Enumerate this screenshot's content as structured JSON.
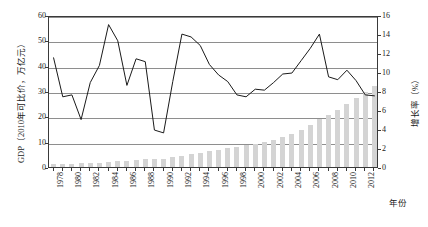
{
  "chart_data": {
    "type": "bar",
    "title": "",
    "subtitle": "",
    "xlabel": "年份",
    "ylabel": "GDP（2010年可比价，万亿元）",
    "ylabel_right": "增长率（%）",
    "ylim": [
      0,
      60
    ],
    "ylim_right": [
      0,
      16
    ],
    "yticks": [
      0,
      10,
      20,
      30,
      40,
      50,
      60
    ],
    "yticks_right": [
      0,
      2,
      4,
      6,
      8,
      10,
      12,
      14,
      16
    ],
    "grid": true,
    "legend": "none",
    "xtick_labels": [
      "1978",
      "1980",
      "1982",
      "1984",
      "1986",
      "1988",
      "1990",
      "1992",
      "1994",
      "1996",
      "1998",
      "2000",
      "2002",
      "2004",
      "2006",
      "2008",
      "2010",
      "2012"
    ],
    "x": [
      1978,
      1979,
      1980,
      1981,
      1982,
      1983,
      1984,
      1985,
      1986,
      1987,
      1988,
      1989,
      1990,
      1991,
      1992,
      1993,
      1994,
      1995,
      1996,
      1997,
      1998,
      1999,
      2000,
      2001,
      2002,
      2003,
      2004,
      2005,
      2006,
      2007,
      2008,
      2009,
      2010,
      2011,
      2012,
      2013
    ],
    "series": [
      {
        "name": "GDP（2010年可比价，万亿元）",
        "type": "bar",
        "axis": "left",
        "color": "#d4d4d4",
        "values": [
          1.1,
          1.2,
          1.3,
          1.4,
          1.5,
          1.7,
          1.9,
          2.2,
          2.4,
          2.7,
          3.0,
          3.2,
          3.3,
          3.8,
          4.3,
          5.0,
          5.6,
          6.2,
          6.8,
          7.4,
          7.9,
          8.5,
          9.2,
          9.9,
          10.8,
          11.9,
          13.1,
          14.6,
          16.5,
          18.8,
          20.6,
          22.6,
          25.0,
          27.4,
          29.5,
          31.9
        ],
        "values_scaled_note": "bar heights drawn on left axis 0-60"
      },
      {
        "name": "增长率（%）",
        "type": "line",
        "axis": "right",
        "color": "#1a1a1a",
        "values": [
          11.7,
          7.6,
          7.8,
          5.2,
          9.1,
          10.9,
          15.2,
          13.5,
          8.8,
          11.6,
          11.3,
          4.1,
          3.8,
          9.2,
          14.2,
          13.9,
          13.0,
          11.0,
          9.9,
          9.2,
          7.8,
          7.6,
          8.4,
          8.3,
          9.1,
          10.0,
          10.1,
          11.4,
          12.7,
          14.2,
          9.7,
          9.4,
          10.4,
          9.3,
          7.8,
          7.7
        ]
      }
    ]
  },
  "axes": {
    "left_title": "GDP（2010年可比价，万亿元）",
    "right_title": "增长率（%）",
    "x_title": "年份"
  },
  "left_ticks": [
    "60",
    "50",
    "40",
    "30",
    "20",
    "10",
    "0"
  ],
  "right_ticks": [
    "16",
    "14",
    "12",
    "10",
    "8",
    "6",
    "4",
    "2",
    "0"
  ]
}
